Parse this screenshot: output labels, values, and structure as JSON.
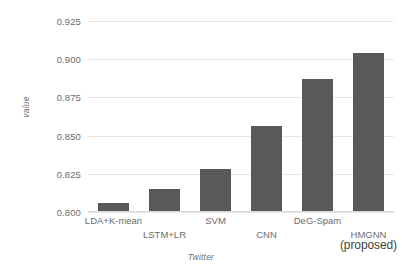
{
  "chart_data": {
    "type": "bar",
    "title": "",
    "xlabel": "Twitter",
    "ylabel": "value",
    "categories": [
      "LDA+K-mean",
      "LSTM+LR",
      "SVM",
      "CNN",
      "DeG-Spam",
      "HMGNN"
    ],
    "category_sublabels": [
      "",
      "",
      "",
      "",
      "",
      "(proposed)"
    ],
    "values": [
      0.806,
      0.815,
      0.828,
      0.856,
      0.887,
      0.904
    ],
    "ylim": [
      0.8,
      0.925
    ],
    "yticks": [
      0.8,
      0.825,
      0.85,
      0.875,
      0.9,
      0.925
    ],
    "ytick_labels": [
      "0.800",
      "0.825",
      "0.850",
      "0.875",
      "0.900",
      "0.925"
    ],
    "grid": true,
    "legend": "none",
    "bar_color": "#595959",
    "grid_color": "#e8e8e8",
    "text_color": "#6b6b6b"
  },
  "axes": {
    "y_title": "value",
    "x_title": "Twitter"
  }
}
